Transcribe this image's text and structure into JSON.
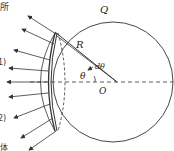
{
  "diagram": {
    "labels": {
      "sphere": "Q",
      "radius": "R",
      "dtheta": "dθ",
      "theta": "θ",
      "center": "O"
    },
    "margin_text": {
      "top": "所",
      "mid1": "1)",
      "mid2": "2)",
      "bottom": "体"
    },
    "colors": {
      "line": "#333333",
      "background": "#ffffff"
    }
  }
}
